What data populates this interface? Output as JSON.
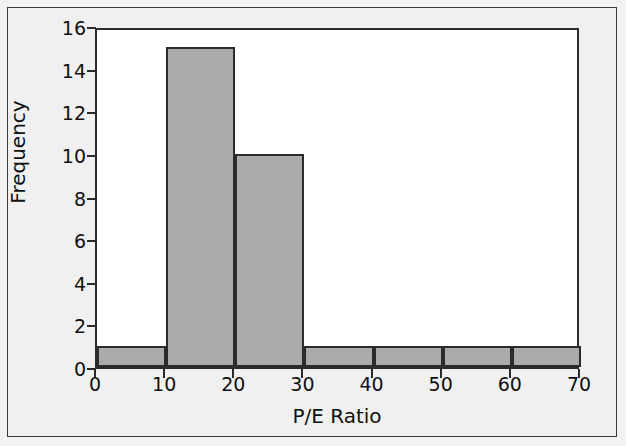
{
  "chart_data": {
    "type": "bar",
    "title": "",
    "subtitle": "",
    "xlabel": "P/E Ratio",
    "ylabel": "Frequency",
    "bin_width": 10,
    "bin_edges": [
      0,
      10,
      20,
      30,
      40,
      50,
      60,
      70
    ],
    "categories": [
      "0-10",
      "10-20",
      "20-30",
      "30-40",
      "40-50",
      "50-60",
      "60-70"
    ],
    "values": [
      1,
      15,
      10,
      1,
      1,
      1,
      1
    ],
    "xlim": [
      0,
      70
    ],
    "ylim": [
      0,
      16
    ],
    "xticks": [
      0,
      10,
      20,
      30,
      40,
      50,
      60,
      70
    ],
    "yticks": [
      0,
      2,
      4,
      6,
      8,
      10,
      12,
      14,
      16
    ],
    "xtick_labels": [
      "0",
      "10",
      "20",
      "30",
      "40",
      "50",
      "60",
      "70"
    ],
    "ytick_labels": [
      "0",
      "2",
      "4",
      "6",
      "8",
      "10",
      "12",
      "14",
      "16"
    ],
    "grid": false,
    "legend": null,
    "annotations": []
  },
  "style": {
    "bar_fill": "#ababab",
    "bar_stroke": "#2b2b2b",
    "axis_color": "#2b2b2b",
    "plot_background": "#ffffff",
    "figure_background": "#f0f0f0",
    "text_color": "#111111"
  }
}
